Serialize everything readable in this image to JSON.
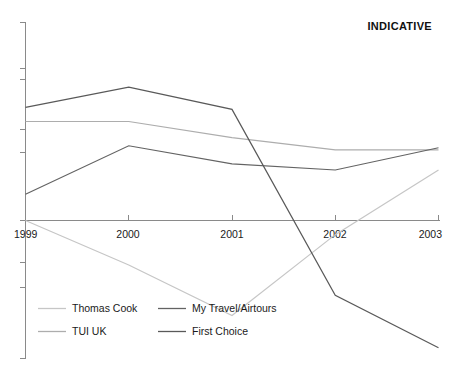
{
  "title": "INDICATIVE",
  "chart_data": {
    "type": "line",
    "title": "INDICATIVE",
    "xlabel": "",
    "ylabel": "",
    "grid": false,
    "legend_position": "bottom-left",
    "x": [
      "1999",
      "2000",
      "2001",
      "2002",
      "2003"
    ],
    "categories": [
      "1999",
      "2000",
      "2001",
      "2002",
      "2003"
    ],
    "xlim": [
      "1999",
      "2003"
    ],
    "ylim": [
      -100,
      100
    ],
    "y_axis_ticks_visible": true,
    "y_axis_tick_labels": [],
    "series": [
      {
        "name": "Thomas Cook",
        "color": "#c6c6c6",
        "values": [
          0,
          -22,
          -47,
          -7,
          25
        ]
      },
      {
        "name": "TUI UK",
        "color": "#adadad",
        "values": [
          49,
          49,
          41,
          35,
          35
        ]
      },
      {
        "name": "My Travel/Airtours",
        "color": "#636363",
        "values": [
          13,
          37,
          28,
          25,
          36
        ]
      },
      {
        "name": "First Choice",
        "color": "#595959",
        "values": [
          56,
          66,
          55,
          -37,
          -63
        ]
      }
    ]
  },
  "axis": {
    "x_tick_labels": [
      "1999",
      "2000",
      "2001",
      "2002",
      "2003"
    ]
  },
  "legend": {
    "entries": [
      {
        "label": "Thomas Cook",
        "color": "#c6c6c6"
      },
      {
        "label": "My Travel/Airtours",
        "color": "#636363"
      },
      {
        "label": "TUI UK",
        "color": "#adadad"
      },
      {
        "label": "First Choice",
        "color": "#595959"
      }
    ]
  }
}
